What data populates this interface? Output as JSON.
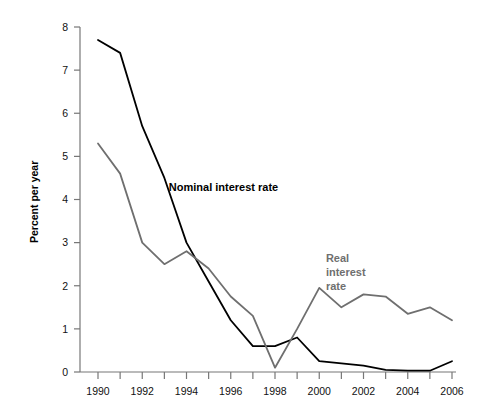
{
  "chart_data": {
    "type": "line",
    "title": "",
    "xlabel": "",
    "ylabel": "Percent per year",
    "xlim": [
      1990,
      2006
    ],
    "ylim": [
      0,
      8
    ],
    "grid": false,
    "legend_position": "inline-annotation",
    "x": [
      1990,
      1991,
      1992,
      1993,
      1994,
      1995,
      1996,
      1997,
      1998,
      1999,
      2000,
      2001,
      2002,
      2003,
      2004,
      2005,
      2006
    ],
    "x_tick_labels": [
      "1990",
      "1992",
      "1994",
      "1996",
      "1998",
      "2000",
      "2002",
      "2004",
      "2006"
    ],
    "x_tick_values": [
      1990,
      1992,
      1994,
      1996,
      1998,
      2000,
      2002,
      2004,
      2006
    ],
    "y_tick_labels": [
      "0",
      "1",
      "2",
      "3",
      "4",
      "5",
      "6",
      "7",
      "8"
    ],
    "y_tick_values": [
      0,
      1,
      2,
      3,
      4,
      5,
      6,
      7,
      8
    ],
    "series": [
      {
        "name": "Nominal interest rate",
        "color": "#000000",
        "label_lines": [
          "Nominal interest rate"
        ],
        "values": [
          7.7,
          7.4,
          5.7,
          4.5,
          3.0,
          2.1,
          1.2,
          0.6,
          0.6,
          0.8,
          0.25,
          0.2,
          0.15,
          0.05,
          0.03,
          0.03,
          0.25
        ]
      },
      {
        "name": "Real interest rate",
        "color": "#6f6f6f",
        "label_lines": [
          "Real",
          "interest",
          "rate"
        ],
        "values": [
          5.3,
          4.6,
          3.0,
          2.5,
          2.8,
          2.4,
          1.75,
          1.3,
          0.1,
          1.0,
          1.95,
          1.5,
          1.8,
          1.75,
          1.35,
          1.5,
          1.2
        ]
      }
    ],
    "annotations": [
      {
        "id": "nominal-annotation",
        "text": "Nominal interest rate",
        "x": 1993.2,
        "y": 4.2
      },
      {
        "id": "real-annotation",
        "text": "Real interest rate",
        "x": 2000.3,
        "y": 2.55
      }
    ]
  }
}
